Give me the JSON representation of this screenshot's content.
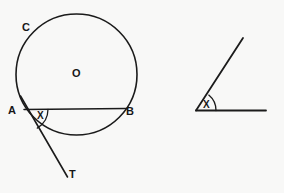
{
  "figure": {
    "background_color": "#f8f8f7",
    "ink_color": "#1b1b1b",
    "width": 284,
    "height": 193,
    "diagrams": [
      {
        "id": "circle-tangent-diagram",
        "description": "Circle with centre O, chord AB, tangent line at A meeting T, alternate segment point C, angle X between chord AB and tangent AT",
        "labels": [
          {
            "name": "point-label-c",
            "text": "C",
            "x": 22,
            "y": 22
          },
          {
            "name": "centre-label-o",
            "text": "O",
            "x": 72,
            "y": 68
          },
          {
            "name": "point-label-a",
            "text": "A",
            "x": 8,
            "y": 105
          },
          {
            "name": "point-label-b",
            "text": "B",
            "x": 126,
            "y": 106
          },
          {
            "name": "point-label-t",
            "text": "T",
            "x": 69,
            "y": 169
          },
          {
            "name": "angle-label-x-left",
            "text": "X",
            "x": 37,
            "y": 111
          }
        ],
        "circle": {
          "cx": 76.5,
          "cy": 74.5,
          "r": 60.5
        },
        "chord": {
          "x1": 24,
          "y1": 109.5,
          "x2": 126,
          "y2": 108.5
        },
        "tangent": {
          "x1": 20.5,
          "y1": 96,
          "x2": 67.5,
          "y2": 177
        },
        "angle_arc_radius": 22
      },
      {
        "id": "plain-angle-diagram",
        "description": "Standalone angle X formed by a horizontal ray and an upward slanted ray from a common vertex",
        "labels": [
          {
            "name": "angle-label-x-right",
            "text": "X",
            "x": 203,
            "y": 100
          }
        ],
        "vertex": {
          "x": 196,
          "y": 110.5
        },
        "horizontal_ray_end": {
          "x": 266,
          "y": 110.5
        },
        "slanted_ray_end": {
          "x": 243,
          "y": 38
        },
        "angle_arc_radius": 20
      }
    ]
  }
}
